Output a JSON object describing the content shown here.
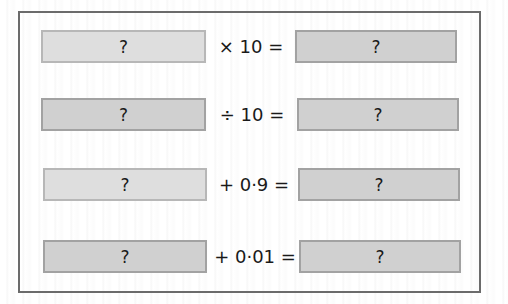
{
  "worksheet": {
    "rows": [
      {
        "input": "?",
        "operation": "× 10 =",
        "output": "?"
      },
      {
        "input": "?",
        "operation": "÷ 10 =",
        "output": "?"
      },
      {
        "input": "?",
        "operation": "+ 0·9 =",
        "output": "?"
      },
      {
        "input": "?",
        "operation": "+ 0·01 =",
        "output": "?"
      }
    ]
  },
  "colors": {
    "frame_border": "#6b6b6b",
    "box_light": "#dedede",
    "box_dark": "#d0d0d0",
    "box_border": "#a9a9a9"
  }
}
